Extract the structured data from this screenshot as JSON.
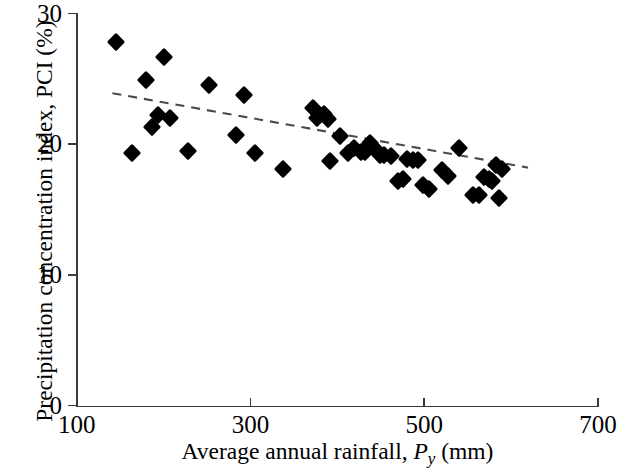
{
  "chart_data": {
    "type": "scatter",
    "title": "",
    "xlabel": "Average annual rainfall, Py (mm)",
    "ylabel": "Precipitation concentration index, PCI (%)",
    "xlabel_parts": {
      "pre": "Average annual rainfall, ",
      "symbol": "P",
      "subscript": "y",
      "post": " (mm)"
    },
    "xlim": [
      100,
      700
    ],
    "ylim": [
      0,
      30
    ],
    "xticks": [
      100,
      300,
      500,
      700
    ],
    "yticks": [
      0,
      10,
      20,
      30
    ],
    "xtick_labels": [
      "100",
      "300",
      "500",
      "700"
    ],
    "ytick_labels": [
      "0",
      "10",
      "20",
      "30"
    ],
    "grid": false,
    "legend": "none",
    "marker_shape": "diamond",
    "marker_color": "#000000",
    "points": [
      {
        "x": 145,
        "y": 27.8
      },
      {
        "x": 163,
        "y": 19.3
      },
      {
        "x": 180,
        "y": 24.9
      },
      {
        "x": 187,
        "y": 21.3
      },
      {
        "x": 193,
        "y": 22.2
      },
      {
        "x": 200,
        "y": 26.7
      },
      {
        "x": 207,
        "y": 22.0
      },
      {
        "x": 228,
        "y": 19.5
      },
      {
        "x": 252,
        "y": 24.5
      },
      {
        "x": 283,
        "y": 20.7
      },
      {
        "x": 293,
        "y": 23.8
      },
      {
        "x": 305,
        "y": 19.3
      },
      {
        "x": 337,
        "y": 18.1
      },
      {
        "x": 372,
        "y": 22.8
      },
      {
        "x": 377,
        "y": 22.0
      },
      {
        "x": 385,
        "y": 22.3
      },
      {
        "x": 389,
        "y": 21.9
      },
      {
        "x": 392,
        "y": 18.7
      },
      {
        "x": 403,
        "y": 20.6
      },
      {
        "x": 412,
        "y": 19.3
      },
      {
        "x": 419,
        "y": 19.7
      },
      {
        "x": 427,
        "y": 19.4
      },
      {
        "x": 432,
        "y": 19.4
      },
      {
        "x": 437,
        "y": 20.1
      },
      {
        "x": 443,
        "y": 19.6
      },
      {
        "x": 449,
        "y": 19.2
      },
      {
        "x": 454,
        "y": 19.2
      },
      {
        "x": 462,
        "y": 19.1
      },
      {
        "x": 470,
        "y": 17.2
      },
      {
        "x": 476,
        "y": 17.3
      },
      {
        "x": 480,
        "y": 18.9
      },
      {
        "x": 487,
        "y": 18.8
      },
      {
        "x": 493,
        "y": 18.8
      },
      {
        "x": 499,
        "y": 16.9
      },
      {
        "x": 506,
        "y": 16.6
      },
      {
        "x": 520,
        "y": 18.0
      },
      {
        "x": 527,
        "y": 17.6
      },
      {
        "x": 540,
        "y": 19.7
      },
      {
        "x": 556,
        "y": 16.1
      },
      {
        "x": 563,
        "y": 16.1
      },
      {
        "x": 569,
        "y": 17.5
      },
      {
        "x": 575,
        "y": 17.3
      },
      {
        "x": 578,
        "y": 17.2
      },
      {
        "x": 583,
        "y": 18.4
      },
      {
        "x": 590,
        "y": 18.1
      },
      {
        "x": 586,
        "y": 15.9
      }
    ],
    "trendline": {
      "style": "dashed",
      "color": "#4a4a4a",
      "x_start": 141,
      "y_start": 23.9,
      "x_end": 620,
      "y_end": 18.2
    }
  }
}
